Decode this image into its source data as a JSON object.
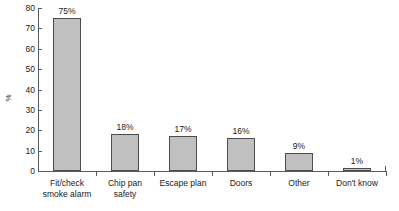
{
  "chart_data": {
    "type": "bar",
    "title": "",
    "subtitle": "",
    "xlabel": "",
    "ylabel": "%",
    "ylim": [
      0,
      80
    ],
    "ytick_step": 10,
    "yticks": [
      80,
      70,
      60,
      50,
      40,
      30,
      20,
      10,
      0
    ],
    "grid": false,
    "legend": false,
    "categories": [
      "Fit/check smoke alarm",
      "Chip pan safety",
      "Escape plan",
      "Doors",
      "Other",
      "Don't know"
    ],
    "category_lines": [
      [
        "Fit/check",
        "smoke alarm"
      ],
      [
        "Chip pan",
        "safety"
      ],
      [
        "Escape plan"
      ],
      [
        "Doors"
      ],
      [
        "Other"
      ],
      [
        "Don't know"
      ]
    ],
    "values": [
      75,
      18,
      17,
      16,
      9,
      1
    ],
    "value_labels": [
      "75%",
      "18%",
      "17%",
      "16%",
      "9%",
      "1%"
    ],
    "colors": {
      "bar_fill": "#c0c0c0",
      "bar_stroke": "#4d4d4d",
      "axis": "#5a5a5a",
      "text": "#1a1a1a",
      "background": "#ffffff"
    }
  }
}
